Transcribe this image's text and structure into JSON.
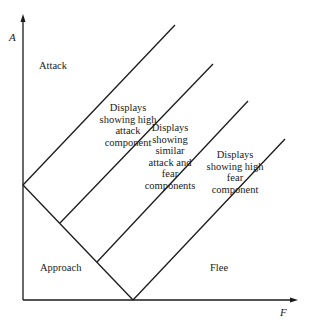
{
  "diagram": {
    "axes": {
      "y_label": "A",
      "x_label": "F"
    },
    "regions": {
      "attack": "Attack",
      "approach": "Approach",
      "flee": "Flee"
    },
    "bands": [
      {
        "lines": [
          "Displays",
          "showing high",
          "attack",
          "component"
        ]
      },
      {
        "lines": [
          "Displays",
          "showing",
          "similar",
          "attack and",
          "fear",
          "components"
        ]
      },
      {
        "lines": [
          "Displays",
          "showing high",
          "fear",
          "component"
        ]
      }
    ],
    "colors": {
      "line": "#1a1a1a",
      "background": "#ffffff"
    }
  }
}
